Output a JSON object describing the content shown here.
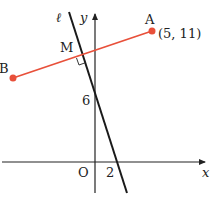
{
  "figure": {
    "type": "coordinate-geometry",
    "axes": {
      "x_label": "x",
      "y_label": "y",
      "origin_label": "O"
    },
    "line": {
      "name": "ℓ",
      "y_intercept_label": "6",
      "x_intercept_label": "2"
    },
    "segment": {
      "color": "#e8503a",
      "point_a": {
        "label": "A",
        "coords": "(5, 11)"
      },
      "point_b": {
        "label": "B"
      },
      "midpoint": {
        "label": "M"
      }
    },
    "colors": {
      "axis": "#222222",
      "line": "#1a1a1a",
      "segment": "#e8503a"
    }
  }
}
